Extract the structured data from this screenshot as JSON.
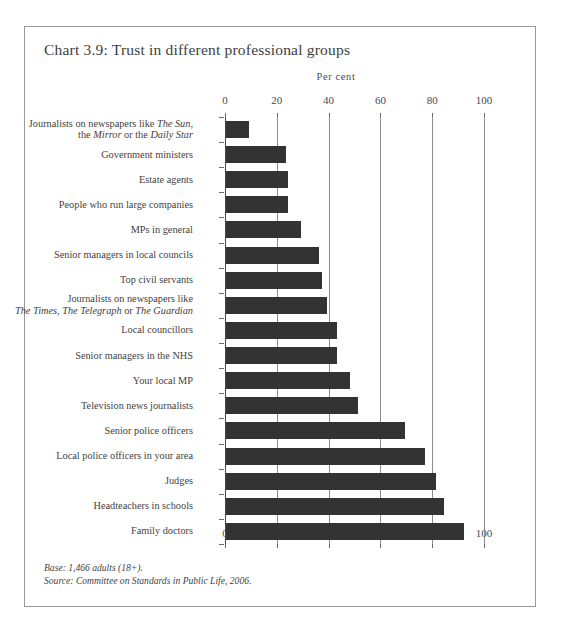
{
  "chart_title": "Chart 3.9: Trust in different professional groups",
  "axis_unit": "Per cent",
  "footnotes": {
    "base": "Base: 1,466 adults (18+).",
    "source": "Source: Committee on Standards in Public Life, 2006."
  },
  "chart_data": {
    "type": "bar",
    "orientation": "horizontal",
    "title": "Chart 3.9: Trust in different professional groups",
    "xlabel": "Per cent",
    "ylabel": "",
    "xlim": [
      0,
      100
    ],
    "xticks": [
      0,
      20,
      40,
      60,
      80,
      100
    ],
    "xtick_labels": [
      "0",
      "20",
      "40",
      "60",
      "80",
      "100"
    ],
    "grid": true,
    "grid_axis": "x",
    "legend": false,
    "bar_color": "#333333",
    "axis_labels_top_and_bottom": true,
    "categories": [
      "Journalists on newspapers like The Sun, the Mirror or the Daily Star",
      "Government ministers",
      "Estate agents",
      "People who run large companies",
      "MPs in general",
      "Senior managers in local councils",
      "Top civil servants",
      "Journalists on newspapers like The Times, The Telegraph or The Guardian",
      "Local councillors",
      "Senior managers in the NHS",
      "Your local MP",
      "Television news journalists",
      "Senior police officers",
      "Local police officers in your area",
      "Judges",
      "Headteachers in schools",
      "Family doctors"
    ],
    "values": [
      9,
      23,
      24,
      24,
      29,
      36,
      37,
      39,
      43,
      43,
      48,
      51,
      69,
      77,
      81,
      84,
      92
    ]
  },
  "categories_html": [
    "Journalists on newspapers like <i>The Sun,</i><br>the <i>Mirror</i> or the <i>Daily Star</i>",
    "Government ministers",
    "Estate agents",
    "People who run large companies",
    "MPs in general",
    "Senior managers in local councils",
    "Top civil servants",
    "Journalists on newspapers like<br><i>The Times, The Telegraph</i> or <i>The Guardian</i>",
    "Local councillors",
    "Senior managers in the NHS",
    "Your local MP",
    "Television news journalists",
    "Senior police officers",
    "Local police officers in your area",
    "Judges",
    "Headteachers in schools",
    "Family doctors"
  ]
}
